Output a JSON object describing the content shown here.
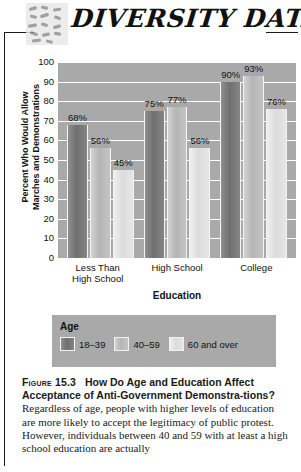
{
  "header": {
    "brand_title": "DIVERSITY DATA",
    "logo_name": "mosaic-logo"
  },
  "chart_data": {
    "type": "bar",
    "title": "",
    "categories": [
      "Less Than High School",
      "High School",
      "College"
    ],
    "category_lines": [
      [
        "Less Than",
        "High School"
      ],
      [
        "High School",
        ""
      ],
      [
        "College",
        ""
      ]
    ],
    "series": [
      {
        "name": "18–39",
        "values": [
          68,
          75,
          90
        ],
        "labels": [
          "68%",
          "75%",
          "90%"
        ],
        "color": "#7a7a7a"
      },
      {
        "name": "40–59",
        "values": [
          56,
          77,
          93
        ],
        "labels": [
          "56%",
          "77%",
          "93%"
        ],
        "color": "#bdbdbd"
      },
      {
        "name": "60 and over",
        "values": [
          45,
          56,
          76
        ],
        "labels": [
          "45%",
          "56%",
          "76%"
        ],
        "color": "#e4e4e4"
      }
    ],
    "xlabel": "Education",
    "ylabel": "Percent Who Would Allow Marches and Demonstrations",
    "ylabel_lines": [
      "Percent Who Would Allow",
      "Marches and Demonstrations"
    ],
    "ylim": [
      0,
      100
    ],
    "yticks": [
      100,
      90,
      80,
      70,
      60,
      50,
      40,
      30,
      20,
      10,
      0
    ],
    "grid": true,
    "legend_position": "bottom",
    "plot_background": "#a9a9a9"
  },
  "legend": {
    "title": "Age",
    "items": [
      {
        "label": "18–39"
      },
      {
        "label": "40–59"
      },
      {
        "label": "60 and over"
      }
    ]
  },
  "caption": {
    "figure_number": "Figure 15.3",
    "headline": "How Do Age and Education Affect Acceptance of Anti-Government Demonstra-tions?",
    "headline_part1": "How Do Age and Education Affect",
    "headline_part2": "Acceptance of Anti-Government Demonstra-",
    "headline_part3": "tions?",
    "body": "Regardless of age, people with higher levels of education are more likely to accept the legitimacy of public protest. However, individuals between 40 and 59 with at least a high school education are actually"
  }
}
